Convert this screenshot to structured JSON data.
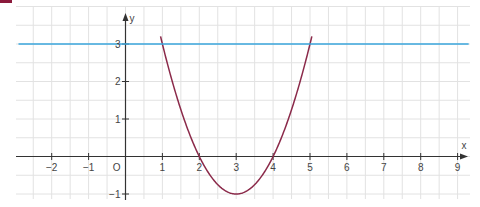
{
  "chart_data": {
    "type": "line",
    "title": "",
    "xlabel": "x",
    "ylabel": "y",
    "xlim": [
      -3,
      9.3
    ],
    "ylim": [
      -1.1,
      4
    ],
    "grid": true,
    "grid_step": 0.5,
    "x_ticks": [
      -2,
      -1,
      1,
      2,
      3,
      4,
      5,
      6,
      7,
      8,
      9
    ],
    "x_tick_labels": [
      "−2",
      "−1",
      "1",
      "2",
      "3",
      "4",
      "5",
      "6",
      "7",
      "8",
      "9"
    ],
    "y_ticks": [
      -1,
      1,
      2,
      3
    ],
    "y_tick_labels": [
      "−1",
      "1",
      "2",
      "3"
    ],
    "origin_label": "O",
    "series": [
      {
        "name": "parabola",
        "expression": "y = x^2 - 6x + 8",
        "color": "#8b2a4a",
        "points": [
          [
            0.95,
            3.8
          ],
          [
            1,
            3
          ],
          [
            2,
            0
          ],
          [
            3,
            -1
          ],
          [
            4,
            0
          ],
          [
            5,
            3
          ],
          [
            5.05,
            3.8
          ]
        ],
        "roots": [
          2,
          4
        ],
        "vertex": [
          3,
          -1
        ]
      },
      {
        "name": "horizontal-line",
        "expression": "y = 3",
        "color": "#3aa6dd",
        "points": [
          [
            -2.9,
            3
          ],
          [
            9.3,
            3
          ]
        ]
      }
    ]
  },
  "colors": {
    "marker": "#8b1a3c",
    "grid": "#e2e2e2",
    "axis": "#333333"
  }
}
